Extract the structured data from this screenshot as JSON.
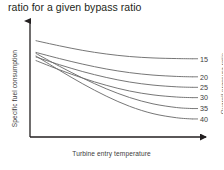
{
  "caption": "ratio for a given bypass ratio",
  "chart_data": {
    "type": "line",
    "title": "ratio for a given bypass ratio",
    "xlabel": "Turbine entry temperature",
    "ylabel": "Specific fuel consumption",
    "right_axis_label": "Overall pressure ratio",
    "grid": false,
    "legend_position": "right-inline-labels",
    "axes_style": "arrows",
    "xlim": [
      0,
      1
    ],
    "ylim": [
      0,
      1
    ],
    "xticklabels": [],
    "yticklabels": [],
    "series": [
      {
        "name": "15",
        "label": "15",
        "color": "#6f6f6f",
        "points": [
          [
            0.0,
            0.895
          ],
          [
            0.15,
            0.845
          ],
          [
            0.3,
            0.8
          ],
          [
            0.45,
            0.765
          ],
          [
            0.6,
            0.74
          ],
          [
            0.75,
            0.726
          ],
          [
            0.9,
            0.72
          ],
          [
            1.0,
            0.718
          ]
        ]
      },
      {
        "name": "20",
        "label": "20",
        "color": "#6f6f6f",
        "points": [
          [
            0.0,
            0.78
          ],
          [
            0.15,
            0.72
          ],
          [
            0.3,
            0.665
          ],
          [
            0.45,
            0.618
          ],
          [
            0.6,
            0.582
          ],
          [
            0.75,
            0.558
          ],
          [
            0.9,
            0.545
          ],
          [
            1.0,
            0.541
          ]
        ]
      },
      {
        "name": "25",
        "label": "25",
        "color": "#6f6f6f",
        "points": [
          [
            0.0,
            0.735
          ],
          [
            0.15,
            0.66
          ],
          [
            0.3,
            0.592
          ],
          [
            0.45,
            0.535
          ],
          [
            0.6,
            0.49
          ],
          [
            0.75,
            0.46
          ],
          [
            0.9,
            0.443
          ],
          [
            1.0,
            0.438
          ]
        ]
      },
      {
        "name": "30",
        "label": "30",
        "color": "#6f6f6f",
        "points": [
          [
            0.0,
            0.7
          ],
          [
            0.15,
            0.61
          ],
          [
            0.3,
            0.528
          ],
          [
            0.45,
            0.458
          ],
          [
            0.6,
            0.402
          ],
          [
            0.75,
            0.364
          ],
          [
            0.9,
            0.343
          ],
          [
            1.0,
            0.337
          ]
        ]
      },
      {
        "name": "35",
        "label": "35",
        "color": "#6f6f6f",
        "points": [
          [
            0.0,
            0.77
          ],
          [
            0.15,
            0.645
          ],
          [
            0.3,
            0.528
          ],
          [
            0.45,
            0.424
          ],
          [
            0.6,
            0.338
          ],
          [
            0.75,
            0.276
          ],
          [
            0.9,
            0.24
          ],
          [
            1.0,
            0.23
          ]
        ]
      },
      {
        "name": "40",
        "label": "40",
        "color": "#6f6f6f",
        "points": [
          [
            0.0,
            0.745
          ],
          [
            0.15,
            0.605
          ],
          [
            0.3,
            0.472
          ],
          [
            0.45,
            0.352
          ],
          [
            0.6,
            0.252
          ],
          [
            0.75,
            0.18
          ],
          [
            0.9,
            0.14
          ],
          [
            1.0,
            0.128
          ]
        ]
      }
    ]
  }
}
